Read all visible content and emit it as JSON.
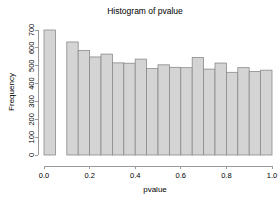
{
  "chart_data": {
    "type": "bar",
    "title": "Histogram of pvalue",
    "xlabel": "pvalue",
    "ylabel": "Frequency",
    "xlim": [
      0.0,
      1.0
    ],
    "ylim": [
      0,
      700
    ],
    "grid": false,
    "legend": null,
    "bin_width": 0.05,
    "bar_color": "#d4d4d4",
    "bar_edge_color": "#8a8a8a",
    "axis_color": "#9a9a9a",
    "xticks": [
      0.0,
      0.2,
      0.4,
      0.6,
      0.8,
      1.0
    ],
    "xtick_labels": [
      "0.0",
      "0.2",
      "0.4",
      "0.6",
      "0.8",
      "1.0"
    ],
    "yticks": [
      0,
      100,
      200,
      300,
      400,
      500,
      600,
      700
    ],
    "ytick_labels": [
      "0",
      "100",
      "200",
      "300",
      "400",
      "500",
      "600",
      "700"
    ],
    "bins": [
      {
        "x0": 0.0,
        "x1": 0.05,
        "value": 700
      },
      {
        "x0": 0.05,
        "x1": 0.1,
        "value": 0
      },
      {
        "x0": 0.1,
        "x1": 0.15,
        "value": 633
      },
      {
        "x0": 0.15,
        "x1": 0.2,
        "value": 585
      },
      {
        "x0": 0.2,
        "x1": 0.25,
        "value": 549
      },
      {
        "x0": 0.25,
        "x1": 0.3,
        "value": 565
      },
      {
        "x0": 0.3,
        "x1": 0.35,
        "value": 516
      },
      {
        "x0": 0.35,
        "x1": 0.4,
        "value": 514
      },
      {
        "x0": 0.4,
        "x1": 0.45,
        "value": 537
      },
      {
        "x0": 0.45,
        "x1": 0.5,
        "value": 484
      },
      {
        "x0": 0.5,
        "x1": 0.55,
        "value": 505
      },
      {
        "x0": 0.55,
        "x1": 0.6,
        "value": 491
      },
      {
        "x0": 0.6,
        "x1": 0.65,
        "value": 489
      },
      {
        "x0": 0.65,
        "x1": 0.7,
        "value": 546
      },
      {
        "x0": 0.7,
        "x1": 0.75,
        "value": 481
      },
      {
        "x0": 0.75,
        "x1": 0.8,
        "value": 515
      },
      {
        "x0": 0.8,
        "x1": 0.85,
        "value": 463
      },
      {
        "x0": 0.85,
        "x1": 0.9,
        "value": 489
      },
      {
        "x0": 0.9,
        "x1": 0.95,
        "value": 467
      },
      {
        "x0": 0.95,
        "x1": 1.0,
        "value": 475
      }
    ]
  }
}
